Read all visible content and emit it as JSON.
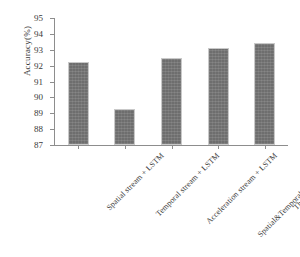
{
  "chart_data": {
    "type": "bar",
    "title": "",
    "xlabel": "",
    "ylabel": "Accuracy(%)",
    "categories": [
      "Spatial stream + LSTM",
      "Temporal stream + LSTM",
      "Acceleration stream + LSTM",
      "Spatial&Temporal stream + LSTM",
      "Three streams + LSTM"
    ],
    "values": [
      92.2,
      89.3,
      92.5,
      93.1,
      93.4
    ],
    "ylim": [
      87,
      95
    ],
    "yticks": [
      87,
      88,
      89,
      90,
      91,
      92,
      93,
      94,
      95
    ],
    "ytick_labels": [
      "87",
      "88",
      "89",
      "90",
      "91",
      "92",
      "93",
      "94",
      "95"
    ],
    "grid": false,
    "legend": null,
    "bar_color": "#6e6e6e",
    "axis_color": "#8d8d8d",
    "text_color": "#3a3a3a"
  }
}
